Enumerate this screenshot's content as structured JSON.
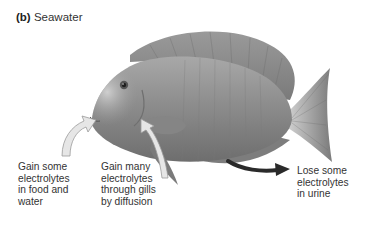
{
  "figure": {
    "panel_letter": "(b)",
    "panel_title": "Seawater",
    "colors": {
      "fish_body": "#8f8f8f",
      "fish_highlight": "#c9c9c9",
      "gain_arrow_fill": "#e6e6e6",
      "gain_arrow_stroke": "#9a9a9a",
      "lose_arrow": "#2a2a2a"
    },
    "annotations": [
      {
        "id": "food",
        "text": "Gain some\nelectrolytes\nin food and\nwater",
        "arrow": "inward-light"
      },
      {
        "id": "gills",
        "text": "Gain many\nelectrolytes\nthrough gills\nby diffusion",
        "arrow": "inward-light"
      },
      {
        "id": "urine",
        "text": "Lose some\nelectrolytes\nin urine",
        "arrow": "outward-dark"
      }
    ]
  }
}
